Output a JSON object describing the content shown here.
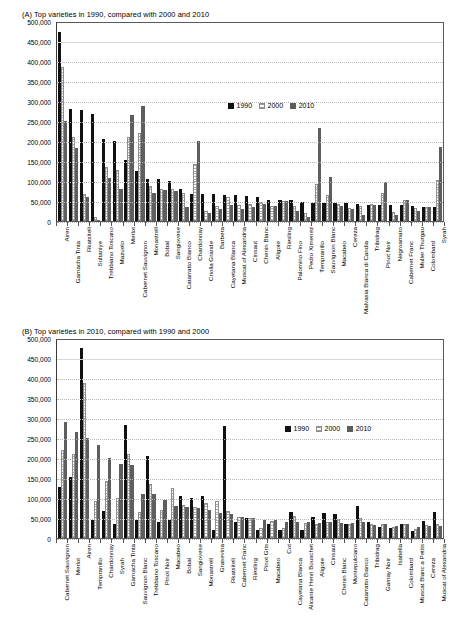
{
  "panels": {
    "a": {
      "title": "(A) Top varieties in 1990, compared with 2000 and 2010"
    },
    "b": {
      "title": "(B) Top varieties in 2010, compared with 1990 and 2000"
    }
  },
  "legend": {
    "items": [
      {
        "label": "1990",
        "color": "#111111"
      },
      {
        "label": "2000",
        "color": "#ffffff"
      },
      {
        "label": "2010",
        "color": "#5e5e5e"
      }
    ]
  },
  "axis": {
    "yticks": [
      "500,000",
      "450,000",
      "400,000",
      "350,000",
      "300,000",
      "250,000",
      "200,000",
      "150,000",
      "100,000",
      "50,000",
      "0"
    ],
    "ymin": 0,
    "ymax": 500000,
    "ystep": 50000
  },
  "chart_data": [
    {
      "type": "bar",
      "id": "panel-a",
      "title": "(A) Top varieties in 1990, compared with 2000 and 2010",
      "xlabel": "",
      "ylabel": "",
      "ylim": [
        0,
        500000
      ],
      "grid": true,
      "legend_position": "upper-center-right",
      "series_names": [
        "1990",
        "2000",
        "2010"
      ],
      "categories": [
        "Airen",
        "Garnacha Tinta",
        "Rkatsiteli",
        "Sultaniye",
        "Trebbiano Toscano",
        "Mazuelo",
        "Merlot",
        "Cabernet Sauvignon",
        "Monastrell",
        "Bobal",
        "Sangiovese",
        "Catarratto Bianco",
        "Chardonnay",
        "Criolla Grande",
        "Barbera",
        "Cayetana Blanca",
        "Muscat of Alexandria",
        "Cinsaut",
        "Chenin Blanc",
        "Aligote",
        "Riesling",
        "Palomino Fino",
        "Pedro Ximenez",
        "Tempranillo",
        "Sauvignon Blanc",
        "Macabeo",
        "Cereza",
        "Malvasia Bianca di Candia",
        "Tribidrag",
        "Pinot Noir",
        "Negroamaro",
        "Cabernet Franc",
        "Muller Thurgau",
        "Colombard",
        "Syrah"
      ],
      "series": [
        {
          "name": "1990",
          "values": [
            473000,
            281000,
            278000,
            268000,
            205000,
            200000,
            153000,
            125000,
            106000,
            104000,
            100000,
            80000,
            68000,
            68000,
            67000,
            66000,
            66000,
            62000,
            60000,
            53000,
            52000,
            52000,
            47000,
            46000,
            45000,
            45000,
            44000,
            42000,
            41000,
            41000,
            41000,
            39000,
            38000,
            36000,
            34000
          ]
        },
        {
          "name": "2000",
          "values": [
            386000,
            211000,
            67000,
            9000,
            135000,
            127000,
            210000,
            220000,
            88000,
            81000,
            79000,
            71000,
            143000,
            24000,
            38000,
            60000,
            40000,
            43000,
            47000,
            37000,
            51000,
            38000,
            19000,
            92000,
            66000,
            42000,
            33000,
            37000,
            42000,
            70000,
            22000,
            53000,
            32000,
            36000,
            102000
          ]
        },
        {
          "name": "2010",
          "values": [
            251000,
            182000,
            59000,
            3000,
            107000,
            80000,
            266000,
            288000,
            70000,
            77000,
            74000,
            35000,
            201000,
            21000,
            31000,
            40000,
            29000,
            35000,
            43000,
            37000,
            49000,
            25000,
            11000,
            232000,
            109000,
            38000,
            30000,
            14000,
            40000,
            97000,
            16000,
            52000,
            25000,
            36000,
            184000
          ]
        }
      ]
    },
    {
      "type": "bar",
      "id": "panel-b",
      "title": "(B) Top varieties in 2010, compared with 1990 and 2000",
      "xlabel": "",
      "ylabel": "",
      "ylim": [
        0,
        500000
      ],
      "grid": true,
      "legend_position": "upper-right",
      "series_names": [
        "1990",
        "2000",
        "2010"
      ],
      "categories": [
        "Cabernet Sauvignon",
        "Merlot",
        "Airen",
        "Tempranillo",
        "Chardonnay",
        "Syrah",
        "Garnacha Tinta",
        "Sauvignon Blanc",
        "Trebbiano Toscano",
        "Pinot Noir",
        "Macabeo",
        "Bobal",
        "Sangiovese",
        "Monastrell",
        "Grasevina",
        "Rkatsiteli",
        "Cabernet Franc",
        "Riesling",
        "Pinot Gris",
        "Macabeo",
        "Cot",
        "Cayetana Blanca",
        "Alicante Henri Bouschet",
        "Aligote",
        "Cinsaut",
        "Chenin Blanc",
        "Montepulciano",
        "Catarratto Bianco",
        "Tribidrag",
        "Gamay Noir",
        "Isabella",
        "Colombard",
        "Muscat Blanc a Petits",
        "Cereza",
        "Muscat of Alexandria"
      ],
      "series": [
        {
          "name": "1990",
          "values": [
            128000,
            153000,
            474000,
            46000,
            68000,
            34000,
            282000,
            45000,
            205000,
            41000,
            45000,
            104000,
            100000,
            106000,
            20000,
            280000,
            39000,
            51000,
            20000,
            34000,
            19000,
            66000,
            21000,
            53000,
            62000,
            59000,
            34000,
            80000,
            41000,
            28000,
            24000,
            36000,
            17000,
            43000,
            65000
          ]
        },
        {
          "name": "2000",
          "values": [
            221000,
            210000,
            387000,
            92000,
            143000,
            100000,
            211000,
            66000,
            135000,
            70000,
            126000,
            82000,
            77000,
            88000,
            92000,
            67000,
            53000,
            49000,
            26000,
            42000,
            25000,
            54000,
            37000,
            36000,
            39000,
            48000,
            34000,
            49000,
            35000,
            34000,
            27000,
            36000,
            23000,
            32000,
            34000
          ]
        },
        {
          "name": "2010",
          "values": [
            289000,
            266000,
            251000,
            233000,
            199000,
            185000,
            182000,
            110000,
            109000,
            96000,
            80000,
            77000,
            75000,
            70000,
            62000,
            60000,
            52000,
            51000,
            44000,
            46000,
            39000,
            40000,
            39000,
            38000,
            39000,
            38000,
            38000,
            39000,
            33000,
            35000,
            31000,
            35000,
            28000,
            31000,
            30000
          ]
        }
      ]
    }
  ]
}
